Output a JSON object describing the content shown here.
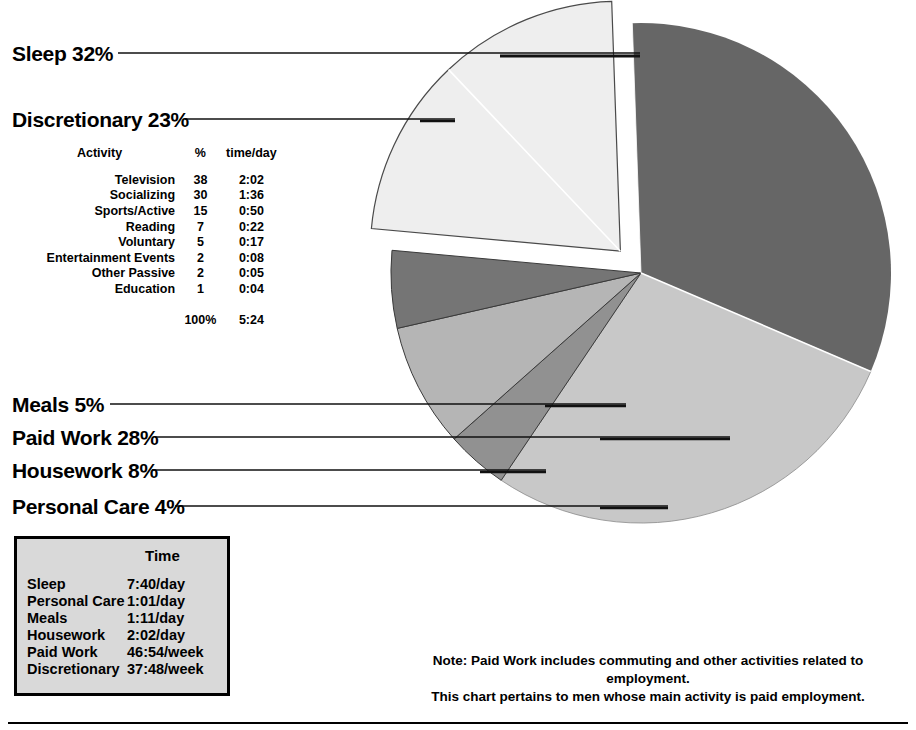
{
  "chart_data": {
    "type": "pie",
    "title": "",
    "unit": "percent",
    "categories": [
      "Sleep",
      "Paid Work",
      "Personal Care",
      "Housework",
      "Meals",
      "Discretionary"
    ],
    "values": [
      32,
      28,
      4,
      8,
      5,
      23
    ],
    "colors": [
      "#666666",
      "#c8c8c8",
      "#919191",
      "#b5b5b5",
      "#757575",
      "#eeeeee"
    ],
    "exploded": [
      "Discretionary"
    ],
    "legend_position": "leader-labels-left",
    "grid": false,
    "annotations": [
      "Paid Work includes commuting and other activities related to employment.",
      "This chart pertains to men whose main activity is paid employment."
    ]
  },
  "slice_labels": {
    "sleep": "Sleep  32%",
    "discretionary": "Discretionary  23%",
    "meals": "Meals  5%",
    "paid_work": "Paid Work  28%",
    "housework": "Housework  8%",
    "personal_care": "Personal Care  4%"
  },
  "activity_table": {
    "headers": {
      "activity": "Activity",
      "percent": "%",
      "time": "time/day"
    },
    "rows": [
      {
        "activity": "Television",
        "percent": "38",
        "time": "2:02"
      },
      {
        "activity": "Socializing",
        "percent": "30",
        "time": "1:36"
      },
      {
        "activity": "Sports/Active",
        "percent": "15",
        "time": "0:50"
      },
      {
        "activity": "Reading",
        "percent": "7",
        "time": "0:22"
      },
      {
        "activity": "Voluntary",
        "percent": "5",
        "time": "0:17"
      },
      {
        "activity": "Entertainment Events",
        "percent": "2",
        "time": "0:08"
      },
      {
        "activity": "Other Passive",
        "percent": "2",
        "time": "0:05"
      },
      {
        "activity": "Education",
        "percent": "1",
        "time": "0:04"
      }
    ],
    "total": {
      "activity": "",
      "percent": "100%",
      "time": "5:24"
    }
  },
  "legend_box": {
    "title": "Time",
    "rows": [
      {
        "name": "Sleep",
        "time": "7:40/day"
      },
      {
        "name": "Personal Care",
        "time": "1:01/day"
      },
      {
        "name": "Meals",
        "time": "1:11/day"
      },
      {
        "name": "Housework",
        "time": "2:02/day"
      },
      {
        "name": "Paid Work",
        "time": "46:54/week"
      },
      {
        "name": "Discretionary",
        "time": "37:48/week"
      }
    ]
  },
  "note": {
    "label": "Note:",
    "line1": "Paid Work includes commuting and other activities related to employment.",
    "line2": "This chart pertains to men whose main activity is paid employment."
  }
}
